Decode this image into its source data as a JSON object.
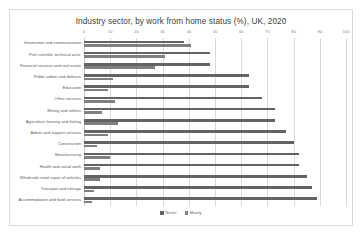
{
  "chart_data": {
    "type": "bar",
    "orientation": "horizontal",
    "title": "Industry sector, by work from home status (%), UK, 2020",
    "xlabel": "",
    "ylabel": "",
    "xlim": [
      0,
      100
    ],
    "xticks": [
      0,
      10,
      20,
      30,
      40,
      50,
      60,
      70,
      80,
      90,
      100
    ],
    "xtick_labels": [
      "0",
      "10",
      "20",
      "30",
      "40",
      "50",
      "60",
      "70",
      "80",
      "90",
      "100"
    ],
    "grid": true,
    "legend_position": "bottom",
    "categories": [
      "Information and communication",
      "Prof scientific technical activ.",
      "Financial services and real estate",
      "Public admin and defence",
      "Education",
      "Other services",
      "Mining and utilities",
      "Agriculture forestry and fishing",
      "Admin and support services",
      "Construction",
      "Manufacturing",
      "Health and social work",
      "Wholesale retail repair of vehicles",
      "Transport and storage",
      "Accommodation and food services"
    ],
    "series": [
      {
        "name": "Never",
        "color": "#636363",
        "values": [
          38,
          48,
          48,
          63,
          63,
          68,
          73,
          73,
          77,
          80,
          82,
          82,
          85,
          87,
          89
        ]
      },
      {
        "name": "Mainly",
        "color": "#7f7f7f",
        "values": [
          41,
          31,
          27,
          11,
          9,
          12,
          7,
          13,
          9,
          5,
          10,
          6,
          6,
          4,
          3
        ]
      }
    ]
  },
  "legend": {
    "items": [
      {
        "label": "Never",
        "color": "#636363"
      },
      {
        "label": "Mainly",
        "color": "#7f7f7f"
      }
    ]
  }
}
